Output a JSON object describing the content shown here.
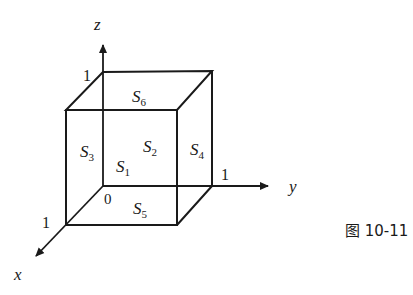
{
  "diagram": {
    "axes": {
      "x": {
        "label": "x",
        "tick": "1"
      },
      "y": {
        "label": "y",
        "tick": "1"
      },
      "z": {
        "label": "z",
        "tick": "1"
      },
      "origin": "0"
    },
    "faces": [
      {
        "name": "S",
        "sub": "1"
      },
      {
        "name": "S",
        "sub": "2"
      },
      {
        "name": "S",
        "sub": "3"
      },
      {
        "name": "S",
        "sub": "4"
      },
      {
        "name": "S",
        "sub": "5"
      },
      {
        "name": "S",
        "sub": "6"
      }
    ],
    "caption": "图 10-11",
    "colors": {
      "stroke": "#1a1a1a",
      "background": "#ffffff"
    }
  }
}
